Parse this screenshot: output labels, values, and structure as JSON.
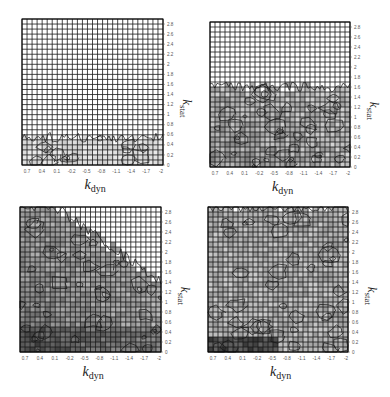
{
  "figure": {
    "background": "#ffffff",
    "grid_color": "#1a1a1a",
    "contour_color": "#111111",
    "tick_color": "#555555"
  },
  "chart_data": [
    {
      "type": "heatmap",
      "panel": "top-left",
      "title": "",
      "xlabel": "k_dyn",
      "ylabel": "k_stat",
      "x_ticks": [
        "0.7",
        "0.4",
        "0.1",
        "-0.2",
        "-0.5",
        "-0.8",
        "-1.1",
        "-1.4",
        "-1.7",
        "-2"
      ],
      "y_ticks": [
        "0",
        "0.2",
        "0.4",
        "0.6",
        "0.8",
        "1",
        "1.2",
        "1.4",
        "1.6",
        "1.8",
        "2",
        "2.2",
        "2.4",
        "2.6",
        "2.8"
      ],
      "xlim": [
        0.9,
        -2.0
      ],
      "ylim": [
        0,
        2.9
      ],
      "grid": true,
      "grid_cols": 28,
      "grid_rows": 29,
      "contour_extent_max_kstat": 0.55,
      "shaded_fraction": 0.0,
      "description": "Contours confined to a thin band near k_stat < 0.6 across all k_dyn"
    },
    {
      "type": "heatmap",
      "panel": "top-right",
      "title": "",
      "xlabel": "k_dyn",
      "ylabel": "k_stat",
      "x_ticks": [
        "0.7",
        "0.4",
        "0.1",
        "-0.2",
        "-0.5",
        "-0.8",
        "-1.1",
        "-1.4",
        "-1.7",
        "-2"
      ],
      "y_ticks": [
        "0",
        "0.2",
        "0.4",
        "0.6",
        "0.8",
        "1",
        "1.2",
        "1.4",
        "1.6",
        "1.8",
        "2",
        "2.2",
        "2.4",
        "2.6",
        "2.8"
      ],
      "xlim": [
        0.9,
        -2.0
      ],
      "ylim": [
        0,
        2.9
      ],
      "grid": true,
      "grid_cols": 28,
      "grid_rows": 29,
      "contour_extent_max_kstat": 1.6,
      "shaded_fraction": 0.15,
      "description": "Contours fill region up to k_stat about 1.5, darker near high k_dyn, low k_stat"
    },
    {
      "type": "heatmap",
      "panel": "bottom-left",
      "title": "",
      "xlabel": "k_dyn",
      "ylabel": "k_stat",
      "x_ticks": [
        "0.7",
        "0.4",
        "0.1",
        "-0.2",
        "-0.5",
        "-0.8",
        "-1.1",
        "-1.4",
        "-1.7",
        "-2"
      ],
      "y_ticks": [
        "0",
        "0.2",
        "0.4",
        "0.6",
        "0.8",
        "1",
        "1.2",
        "1.4",
        "1.6",
        "1.8",
        "2",
        "2.2",
        "2.4",
        "2.6",
        "2.8"
      ],
      "xlim": [
        0.9,
        -2.0
      ],
      "ylim": [
        0,
        2.9
      ],
      "grid": true,
      "grid_cols": 28,
      "grid_rows": 29,
      "contour_extent_max_kstat": 2.9,
      "shaded_fraction": 0.6,
      "description": "Contours cover full left side; boundary descends diagonally to k_stat about 1.4 at right; dark shading lower-left"
    },
    {
      "type": "heatmap",
      "panel": "bottom-right",
      "title": "",
      "xlabel": "k_dyn",
      "ylabel": "k_stat",
      "x_ticks": [
        "0.7",
        "0.4",
        "0.1",
        "-0.2",
        "-0.5",
        "-0.8",
        "-1.1",
        "-1.4",
        "-1.7",
        "-2"
      ],
      "y_ticks": [
        "0",
        "0.2",
        "0.4",
        "0.6",
        "0.8",
        "1",
        "1.2",
        "1.4",
        "1.6",
        "1.8",
        "2",
        "2.2",
        "2.4",
        "2.6",
        "2.8"
      ],
      "xlim": [
        0.9,
        -2.0
      ],
      "ylim": [
        0,
        2.9
      ],
      "grid": true,
      "grid_cols": 28,
      "grid_rows": 29,
      "contour_extent_max_kstat": 2.9,
      "shaded_fraction": 0.45,
      "description": "Contours fill entire domain; dark band along bottom near k_stat < 0.3"
    }
  ],
  "panels": [
    {
      "id": "top-left",
      "x": 22,
      "y": 19,
      "w": 141,
      "h": 146
    },
    {
      "id": "top-right",
      "x": 210,
      "y": 22,
      "w": 140,
      "h": 145
    },
    {
      "id": "bottom-left",
      "x": 20,
      "y": 207,
      "w": 141,
      "h": 145
    },
    {
      "id": "bottom-right",
      "x": 208,
      "y": 207,
      "w": 140,
      "h": 145
    }
  ],
  "labels": {
    "x_axis_main": "k",
    "x_axis_sub": "dyn",
    "y_axis_main": "k",
    "y_axis_sub": "stat"
  }
}
